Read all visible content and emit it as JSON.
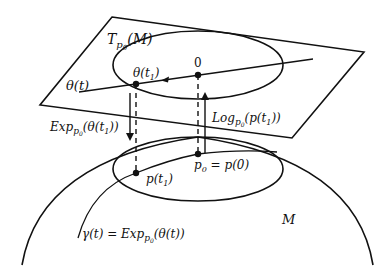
{
  "diagram": {
    "labels": {
      "tangent_space": {
        "main": "T",
        "sub": "p",
        "subsub": "0",
        "arg": "(M)"
      },
      "theta_t": "θ(t)",
      "theta_t1": {
        "main": "θ(t",
        "sub": "1",
        "close": ")"
      },
      "origin": "0",
      "exp_map": {
        "main": "Exp",
        "sub": "p",
        "subsub": "0",
        "arg": "(θ(t",
        "argsub": "1",
        "close": "))"
      },
      "log_map": {
        "main": "Log",
        "sub": "p",
        "subsub": "0",
        "arg": "(p(t",
        "argsub": "1",
        "close": "))"
      },
      "p_t1": {
        "main": "p(t",
        "sub": "1",
        "close": ")"
      },
      "p0": {
        "main": "p",
        "sub": "0",
        "rest": " = p(0)"
      },
      "manifold": "M",
      "gamma": {
        "main": "γ(t) = Exp",
        "sub": "p",
        "subsub": "0",
        "arg": "(θ(t))"
      }
    },
    "colors": {
      "stroke": "#111111",
      "background": "#ffffff"
    }
  }
}
